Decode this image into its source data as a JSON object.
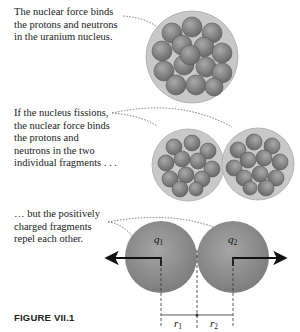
{
  "figure": {
    "label": "FIGURE VII.1",
    "captions": [
      {
        "lines": [
          "The nuclear force binds",
          "the protons and neutrons",
          "in the uranium nucleus."
        ]
      },
      {
        "lines": [
          "If the nucleus fissions,",
          "the nuclear force binds",
          "the protons and",
          "neutrons in the two",
          "individual fragments . . ."
        ]
      },
      {
        "lines": [
          "… but the positively",
          "charged fragments",
          "repel each other."
        ]
      }
    ],
    "labels": {
      "q1": "q",
      "q1_sub": "1",
      "q2": "q",
      "q2_sub": "2",
      "r1": "r",
      "r1_sub": "1",
      "r2": "r",
      "r2_sub": "2"
    },
    "colors": {
      "sphere": "#8c8c8c",
      "nucleon": "#7a7a7a",
      "halo": "#c8c8c8",
      "arrow": "#111111",
      "leader": "#777777"
    }
  }
}
